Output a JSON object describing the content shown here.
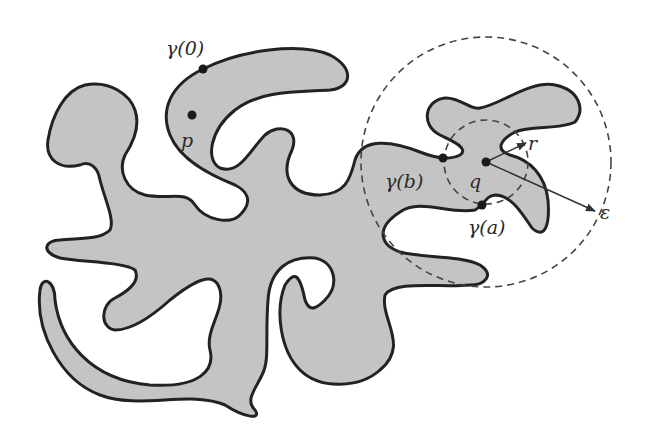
{
  "figure": {
    "colors": {
      "region_fill": "#c4c4c4",
      "outline": "#222222",
      "dashed": "#444444",
      "background": "#ffffff"
    }
  },
  "labels": {
    "gamma0": "γ(0)",
    "p": "p",
    "gamma_b": "γ(b)",
    "q": "q",
    "gamma_a": "γ(a)",
    "r": "r",
    "epsilon": "ε"
  },
  "points": {
    "gamma0": {
      "x": 203,
      "y": 69
    },
    "p": {
      "x": 192,
      "y": 115
    },
    "gamma_b": {
      "x": 443,
      "y": 158
    },
    "q": {
      "x": 486,
      "y": 162
    },
    "gamma_a": {
      "x": 482,
      "y": 205
    }
  },
  "circles": [
    {
      "name": "radius-r-circle",
      "cx": 486,
      "cy": 162,
      "r": 42
    },
    {
      "name": "radius-epsilon-circle",
      "cx": 486,
      "cy": 162,
      "r": 125
    }
  ],
  "arrows": [
    {
      "name": "r-arrow",
      "from": [
        486,
        162
      ],
      "to": [
        526,
        143
      ]
    },
    {
      "name": "epsilon-arrow",
      "from": [
        486,
        162
      ],
      "to": [
        595,
        211
      ]
    }
  ]
}
